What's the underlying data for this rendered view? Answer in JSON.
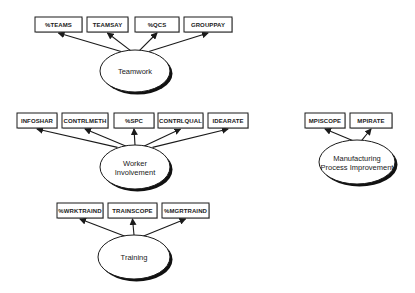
{
  "diagram": {
    "type": "measurement-model",
    "colors": {
      "background": "#ffffff",
      "stroke": "#1a1a1a",
      "shadow": "#111111",
      "text": "#1a1a1a"
    },
    "factors": [
      {
        "id": "teamwork",
        "label_lines": [
          "Teamwork"
        ],
        "ellipse": {
          "cx": 135,
          "cy": 71,
          "rx": 35,
          "ry": 21
        },
        "indicators": [
          {
            "label": "%TEAMS",
            "x": 35,
            "y": 17,
            "w": 47,
            "h": 15
          },
          {
            "label": "TEAMSAY",
            "x": 87,
            "y": 17,
            "w": 41,
            "h": 15
          },
          {
            "label": "%QCS",
            "x": 135,
            "y": 17,
            "w": 44,
            "h": 15
          },
          {
            "label": "GROUPPAY",
            "x": 184,
            "y": 17,
            "w": 48,
            "h": 15
          }
        ]
      },
      {
        "id": "worker-involvement",
        "label_lines": [
          "Worker",
          "Involvement"
        ],
        "ellipse": {
          "cx": 135,
          "cy": 167,
          "rx": 35,
          "ry": 22
        },
        "indicators": [
          {
            "label": "INFOSHAR",
            "x": 17,
            "y": 113,
            "w": 40,
            "h": 15
          },
          {
            "label": "CONTRLMETH",
            "x": 62,
            "y": 113,
            "w": 46,
            "h": 15
          },
          {
            "label": "%SPC",
            "x": 114,
            "y": 113,
            "w": 40,
            "h": 15
          },
          {
            "label": "CONTRLQUAL",
            "x": 158,
            "y": 113,
            "w": 45,
            "h": 15
          },
          {
            "label": "IDEARATE",
            "x": 208,
            "y": 113,
            "w": 40,
            "h": 15
          }
        ]
      },
      {
        "id": "training",
        "label_lines": [
          "Training"
        ],
        "ellipse": {
          "cx": 134,
          "cy": 257,
          "rx": 36,
          "ry": 22
        },
        "indicators": [
          {
            "label": "%WRKTRAIND",
            "x": 57,
            "y": 203,
            "w": 46,
            "h": 15
          },
          {
            "label": "TRAINSCOPE",
            "x": 108,
            "y": 203,
            "w": 49,
            "h": 15
          },
          {
            "label": "%MGRTRAIND",
            "x": 162,
            "y": 203,
            "w": 47,
            "h": 15
          }
        ]
      },
      {
        "id": "manufacturing-process-improvement",
        "label_lines": [
          "Manufacturing",
          "Process Improvement"
        ],
        "ellipse": {
          "cx": 357,
          "cy": 162,
          "rx": 38,
          "ry": 22
        },
        "indicators": [
          {
            "label": "MPISCOPE",
            "x": 305,
            "y": 113,
            "w": 40,
            "h": 15
          },
          {
            "label": "MPIRATE",
            "x": 350,
            "y": 113,
            "w": 42,
            "h": 15
          }
        ]
      }
    ]
  }
}
